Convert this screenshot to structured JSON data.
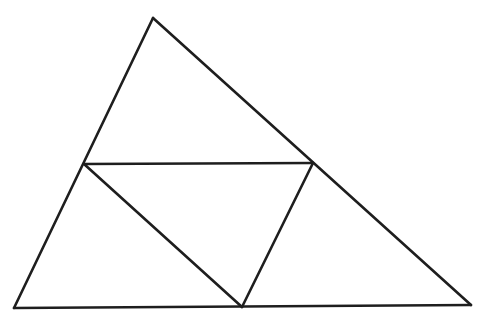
{
  "diagram": {
    "type": "triangle-midpoint-subdivision",
    "width": 488,
    "height": 327,
    "stroke_color": "#1e1e1e",
    "vertices": {
      "A_top": [
        153,
        18
      ],
      "B_bottom_left": [
        14,
        308
      ],
      "C_bottom_right": [
        471,
        305
      ],
      "D_mid_AB": [
        84,
        164
      ],
      "E_mid_AC": [
        313,
        163
      ],
      "F_mid_BC": [
        242,
        307
      ]
    },
    "edges": [
      {
        "id": "outer-left",
        "from": "A_top",
        "to": "B_bottom_left"
      },
      {
        "id": "outer-right",
        "from": "A_top",
        "to": "C_bottom_right"
      },
      {
        "id": "outer-base",
        "from": "B_bottom_left",
        "to": "C_bottom_right"
      },
      {
        "id": "mid-DE",
        "from": "D_mid_AB",
        "to": "E_mid_AC"
      },
      {
        "id": "mid-DF",
        "from": "D_mid_AB",
        "to": "F_mid_BC"
      },
      {
        "id": "mid-EF",
        "from": "E_mid_AC",
        "to": "F_mid_BC"
      }
    ]
  }
}
